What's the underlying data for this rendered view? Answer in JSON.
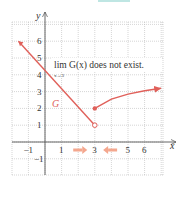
{
  "chart_data": {
    "type": "line",
    "title": "",
    "xlabel": "x",
    "ylabel": "y",
    "xlim": [
      -1.6,
      7
    ],
    "ylim": [
      -2,
      7.2
    ],
    "grid": true,
    "x_tick_labels": [
      "-1",
      "1",
      "3",
      "5",
      "6"
    ],
    "y_tick_labels": [
      "-1",
      "1",
      "2",
      "3",
      "4",
      "5",
      "6"
    ],
    "curve_label": "G",
    "annotation": {
      "main": "lim G(x) does not exist.",
      "sub": "x→3"
    },
    "series": [
      {
        "name": "G left piece",
        "points": [
          [
            -1.6,
            6
          ],
          [
            3,
            1
          ]
        ],
        "end_marker": "open"
      },
      {
        "name": "G right piece",
        "points": [
          [
            3,
            2
          ],
          [
            4,
            2.55
          ],
          [
            5,
            2.85
          ],
          [
            6,
            3.05
          ],
          [
            7,
            3.2
          ]
        ],
        "start_marker": "closed"
      }
    ],
    "approach_arrows": [
      {
        "direction": "right",
        "toward": 3
      },
      {
        "direction": "left",
        "toward": 3
      }
    ],
    "colors": {
      "curve": "#e0605a",
      "arrows": "#f4a78e",
      "grid": "#b9b9b9",
      "axes": "#555555",
      "text": "#333333"
    }
  }
}
